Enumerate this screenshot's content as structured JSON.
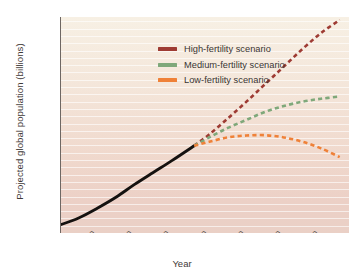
{
  "chart_data": {
    "type": "line",
    "title": "",
    "xlabel": "Year",
    "ylabel": "Projected global population (billions)",
    "xlim": [
      1950,
      2105
    ],
    "ylim": [
      2,
      16.8
    ],
    "grid": true,
    "grid_orientation": "horizontal",
    "legend_position": "upper left",
    "x_tick_labels": [
      "1960",
      "1980",
      "2000",
      "2020",
      "2040",
      "2060",
      "2080",
      "2100"
    ],
    "x_tick_values": [
      1960,
      1980,
      2000,
      2020,
      2040,
      2060,
      2080,
      2100
    ],
    "x_minor_tick_values": [
      1950,
      1970,
      1990,
      2010,
      2030,
      2050,
      2070,
      2090
    ],
    "y_tick_labels": [
      "2",
      "4",
      "6",
      "8",
      "10",
      "12",
      "14",
      "16"
    ],
    "y_tick_values": [
      2,
      4,
      6,
      8,
      10,
      12,
      14,
      16
    ],
    "y_minor_tick_values": [
      3,
      5,
      7,
      9,
      11,
      13,
      15
    ],
    "series": [
      {
        "name": "Historical",
        "style": "solid",
        "color": "#151210",
        "in_legend": false,
        "x": [
          1950,
          1960,
          1970,
          1980,
          1990,
          2000,
          2010,
          2022
        ],
        "values": [
          2.55,
          3.03,
          3.7,
          4.45,
          5.33,
          6.15,
          6.96,
          7.98
        ]
      },
      {
        "name": "High-fertility scenario",
        "style": "dashed",
        "color": "#9e3b33",
        "in_legend": true,
        "x": [
          2022,
          2030,
          2040,
          2050,
          2060,
          2070,
          2080,
          2090,
          2100
        ],
        "values": [
          7.98,
          8.75,
          9.85,
          11.0,
          12.2,
          13.4,
          14.6,
          15.7,
          16.6
        ]
      },
      {
        "name": "Medium-fertility scenario",
        "style": "dashed",
        "color": "#7fa87a",
        "in_legend": true,
        "x": [
          2022,
          2030,
          2040,
          2050,
          2060,
          2070,
          2080,
          2090,
          2100
        ],
        "values": [
          7.98,
          8.55,
          9.2,
          9.75,
          10.3,
          10.7,
          11.0,
          11.2,
          11.35
        ]
      },
      {
        "name": "Low-fertility scenario",
        "style": "dashed",
        "color": "#ef8138",
        "in_legend": true,
        "x": [
          2022,
          2030,
          2040,
          2050,
          2060,
          2070,
          2080,
          2090,
          2100
        ],
        "values": [
          7.98,
          8.25,
          8.55,
          8.68,
          8.7,
          8.55,
          8.25,
          7.8,
          7.2
        ]
      }
    ]
  },
  "legend": {
    "items": [
      {
        "label": "High-fertility scenario",
        "color": "#9e3b33"
      },
      {
        "label": "Medium-fertility scenario",
        "color": "#7fa87a"
      },
      {
        "label": "Low-fertility scenario",
        "color": "#ef8138"
      }
    ]
  },
  "axes": {
    "x_title": "Year",
    "y_title": "Projected global population (billions)"
  },
  "colors": {
    "plot_background_top": "#f7f0e4",
    "plot_background_bottom": "#ead0c6",
    "gridline": "#ffffff",
    "axis": "#6e6763",
    "text": "#3a3532",
    "historical_line": "#151210",
    "high": "#9e3b33",
    "medium": "#7fa87a",
    "low": "#ef8138"
  }
}
